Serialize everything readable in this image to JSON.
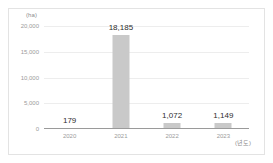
{
  "chart_data": {
    "type": "bar",
    "title": "",
    "subtitle": "",
    "xlabel": "(년도)",
    "ylabel": "(ha)",
    "categories": [
      "2020",
      "2021",
      "2022",
      "2023"
    ],
    "values": [
      179,
      18185,
      1072,
      1149
    ],
    "value_labels": [
      "179",
      "18,185",
      "1,072",
      "1,149"
    ],
    "ylim": [
      0,
      20000
    ],
    "yticks": [
      0,
      5000,
      10000,
      15000,
      20000
    ],
    "ytick_labels": [
      "0",
      "5,000",
      "10,000",
      "15,000",
      "20,000"
    ],
    "grid": true,
    "grid_axis": "y",
    "legend": false,
    "legend_position": "none",
    "series": [
      {
        "name": "",
        "values": [
          179,
          18185,
          1072,
          1149
        ]
      }
    ]
  },
  "style": {
    "bar_color": "#c9c9c9",
    "grid_color": "#ededed",
    "axis_color": "#9a9a9a",
    "tick_text_color": "#9b9b9b",
    "value_text_color": "#2e2e2e",
    "caption_color": "#8c8c8c",
    "frame_color": "#e3e3e3",
    "background": "#ffffff"
  }
}
